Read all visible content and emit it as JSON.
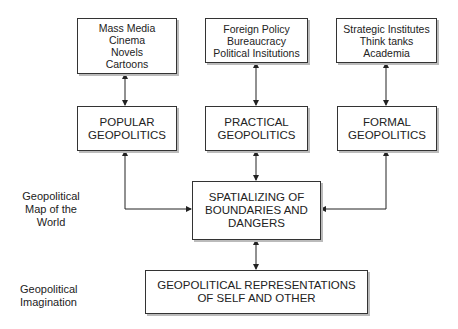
{
  "sources": [
    {
      "id": "popular-sources",
      "lines": [
        "Mass Media",
        "Cinema",
        "Novels",
        "Cartoons"
      ]
    },
    {
      "id": "practical-sources",
      "lines": [
        "Foreign Policy",
        "Bureaucracy",
        "Political Insitutions"
      ]
    },
    {
      "id": "formal-sources",
      "lines": [
        "Strategic Institutes",
        "Think tanks",
        "Academia"
      ]
    }
  ],
  "geopolitics": [
    {
      "id": "popular",
      "lines": [
        "POPULAR",
        "GEOPOLITICS"
      ]
    },
    {
      "id": "practical",
      "lines": [
        "PRACTICAL",
        "GEOPOLITICS"
      ]
    },
    {
      "id": "formal",
      "lines": [
        "FORMAL",
        "GEOPOLITICS"
      ]
    }
  ],
  "spatializing": {
    "lines": [
      "SPATIALIZING OF",
      "BOUNDARIES AND",
      "DANGERS"
    ]
  },
  "representations": {
    "lines": [
      "GEOPOLITICAL REPRESENTATIONS",
      "OF SELF AND OTHER"
    ]
  },
  "side_labels": {
    "map": [
      "Geopolitical",
      "Map of the",
      "World"
    ],
    "imagination": [
      "Geopolitical",
      "Imagination"
    ]
  }
}
